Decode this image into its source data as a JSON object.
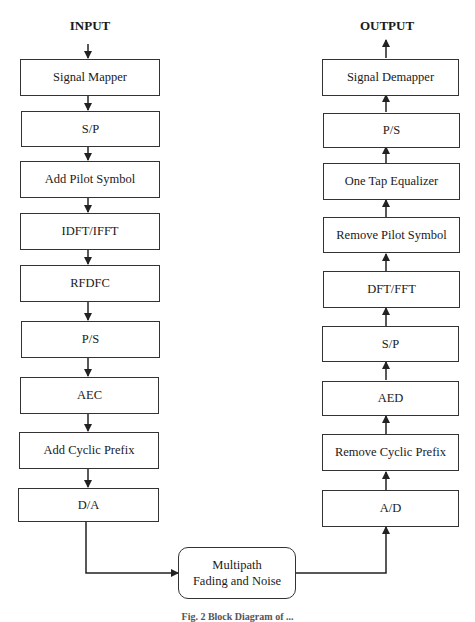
{
  "diagram": {
    "input_label": "INPUT",
    "output_label": "OUTPUT",
    "transmitter": [
      "Signal Mapper",
      "S/P",
      "Add Pilot Symbol",
      "IDFT/IFFT",
      "RFDFC",
      "P/S",
      "AEC",
      "Add Cyclic Prefix",
      "D/A"
    ],
    "receiver": [
      "Signal Demapper",
      "P/S",
      "One Tap Equalizer",
      "Remove Pilot Symbol",
      "DFT/FFT",
      "S/P",
      "AED",
      "Remove Cyclic Prefix",
      "A/D"
    ],
    "channel": {
      "line1": "Multipath",
      "line2": "Fading and Noise"
    },
    "caption": "Fig. 2  Block Diagram of ..."
  }
}
